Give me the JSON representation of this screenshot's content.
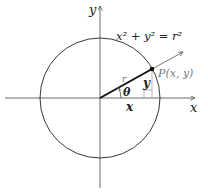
{
  "diagram": {
    "equation": "x² + y² = r²",
    "axes": {
      "x_label": "x",
      "y_label": "y"
    },
    "point_label": "P(x, y)",
    "radius_label": "r",
    "angle_label": "θ",
    "horizontal_leg_label": "x",
    "vertical_leg_label": "y",
    "colors": {
      "stroke": "#222222",
      "label_gray": "#777777",
      "background": "#ffffff"
    }
  }
}
